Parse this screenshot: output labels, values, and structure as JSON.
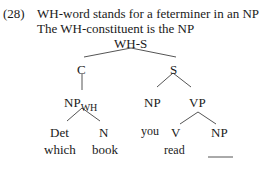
{
  "example": {
    "number": "(28)",
    "line1": "WH-word stands for a feterminer in an NP",
    "line2": "The WH-constituent is the NP"
  },
  "tree": {
    "root": "WH-S",
    "c": "C",
    "s": "S",
    "np_wh": "NP",
    "np_wh_sub": "WH",
    "det": "Det",
    "det_word": "which",
    "n": "N",
    "n_word": "book",
    "s_np": "NP",
    "s_np_word": "you",
    "vp": "VP",
    "v": "V",
    "v_word": "read",
    "vp_np": "NP",
    "gap": "____"
  },
  "colors": {
    "text": "#1a1a1a",
    "lines": "#555555",
    "background": "#ffffff"
  }
}
